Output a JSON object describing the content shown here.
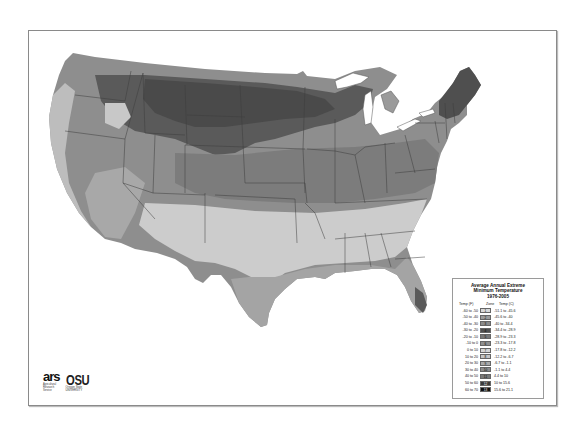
{
  "map": {
    "title": "USDA Plant Hardiness Zone Map (Contiguous United States)",
    "background": "#ffffff",
    "state_border_color": "#3c3c3c",
    "lakes_color": "#ffffff"
  },
  "legend": {
    "title_line1": "Average Annual Extreme",
    "title_line2": "Minimum Temperature",
    "title_line3": "1976-2005",
    "col_f": "Temp (F)",
    "col_zone": "Zone",
    "col_c": "Temp (C)",
    "rows": [
      {
        "f": "-60 to -50",
        "zone": "1",
        "c": "-51.1 to -45.6",
        "color": "#d9d9d9"
      },
      {
        "f": "-50 to -40",
        "zone": "2",
        "c": "-45.6 to -40",
        "color": "#9c9c9c"
      },
      {
        "f": "-40 to -30",
        "zone": "3",
        "c": "-40 to -34.4",
        "color": "#8a8a8a"
      },
      {
        "f": "-30 to -20",
        "zone": "4",
        "c": "-34.4 to -28.9",
        "color": "#4f4f4f"
      },
      {
        "f": "-20 to -10",
        "zone": "5",
        "c": "-28.9 to -23.3",
        "color": "#777777"
      },
      {
        "f": "-10 to 0",
        "zone": "6",
        "c": "-23.3 to -17.8",
        "color": "#8f8f8f"
      },
      {
        "f": "0 to 10",
        "zone": "7",
        "c": "-17.8 to -12.2",
        "color": "#d4d4d4"
      },
      {
        "f": "10 to 20",
        "zone": "8",
        "c": "-12.2 to -6.7",
        "color": "#c4c4c4"
      },
      {
        "f": "20 to 30",
        "zone": "9",
        "c": "-6.7 to -1.1",
        "color": "#a9a9a9"
      },
      {
        "f": "30 to 40",
        "zone": "10",
        "c": "-1.1 to 4.4",
        "color": "#8c8c8c"
      },
      {
        "f": "40 to 50",
        "zone": "11",
        "c": "4.4 to 10",
        "color": "#7a7a7a"
      },
      {
        "f": "50 to 60",
        "zone": "12",
        "c": "10 to 15.6",
        "color": "#3a3a3a"
      },
      {
        "f": "60 to 70",
        "zone": "13",
        "c": "15.6 to 21.1",
        "color": "#111111"
      }
    ]
  },
  "logos": {
    "ars_mark": "ars",
    "ars_text_1": "Agricultural",
    "ars_text_2": "Research",
    "ars_text_3": "Service",
    "osu_mark": "OSU",
    "osu_text": "Oregon State",
    "osu_subtext": "UNIVERSITY"
  }
}
